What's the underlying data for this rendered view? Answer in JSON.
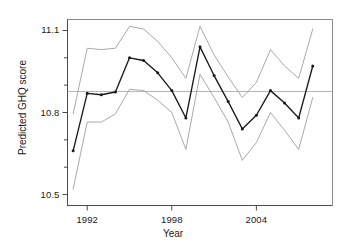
{
  "chart_data": {
    "type": "line",
    "title": "",
    "xlabel": "Year",
    "ylabel": "Predicted GHQ score",
    "xlim": [
      1990.6,
      2009.4
    ],
    "ylim": [
      10.46,
      11.14
    ],
    "grid": false,
    "legend": "none",
    "x": [
      1991,
      1992,
      1993,
      1994,
      1995,
      1996,
      1997,
      1998,
      1999,
      2000,
      2001,
      2002,
      2003,
      2004,
      2005,
      2006,
      2007,
      2008
    ],
    "xticks": [
      1992,
      1998,
      2004
    ],
    "xticklabels": [
      "1992",
      "1998",
      "2004"
    ],
    "yticks": [
      10.5,
      10.6,
      10.7,
      10.8,
      10.9,
      11.0,
      11.1
    ],
    "yticklabels_major": [
      "10.5",
      "10.8",
      "11.1"
    ],
    "ymajor": [
      10.5,
      10.8,
      11.1
    ],
    "reference_line": {
      "value": 10.877,
      "orientation": "horizontal",
      "color": "#b4b4b4"
    },
    "series": [
      {
        "name": "Predicted GHQ score",
        "role": "estimate",
        "color": "#1a1a1a",
        "markers": true,
        "values": [
          10.66,
          10.87,
          10.865,
          10.875,
          11.0,
          10.99,
          10.945,
          10.88,
          10.78,
          11.04,
          10.935,
          10.84,
          10.74,
          10.79,
          10.88,
          10.835,
          10.78,
          10.97
        ]
      },
      {
        "name": "Upper confidence limit",
        "role": "ci-upper",
        "color": "#9a9a9a",
        "markers": false,
        "values": [
          10.795,
          11.035,
          11.03,
          11.035,
          11.115,
          11.105,
          11.06,
          11.0,
          10.925,
          11.115,
          11.01,
          10.93,
          10.855,
          10.91,
          11.03,
          10.97,
          10.925,
          11.105
        ]
      },
      {
        "name": "Lower confidence limit",
        "role": "ci-lower",
        "color": "#9a9a9a",
        "markers": false,
        "values": [
          10.52,
          10.765,
          10.765,
          10.795,
          10.885,
          10.88,
          10.845,
          10.8,
          10.665,
          10.94,
          10.855,
          10.765,
          10.625,
          10.69,
          10.8,
          10.735,
          10.665,
          10.855
        ]
      }
    ]
  },
  "axes": {
    "x_axis_name": "Year",
    "y_axis_name": "Predicted GHQ score"
  }
}
